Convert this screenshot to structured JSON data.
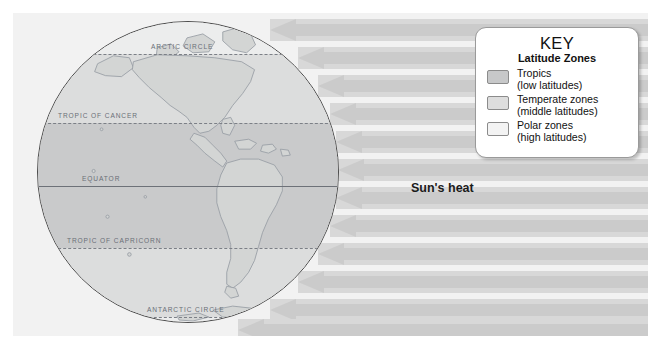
{
  "diagram": {
    "sun_heat_label": "Sun's heat"
  },
  "globe": {
    "latitude_labels": [
      {
        "name": "arctic-circle",
        "text": "ARCTIC CIRCLE"
      },
      {
        "name": "tropic-of-cancer",
        "text": "TROPIC OF CANCER"
      },
      {
        "name": "equator",
        "text": "EQUATOR"
      },
      {
        "name": "tropic-of-capricorn",
        "text": "TROPIC OF CAPRICORN"
      },
      {
        "name": "antarctic-circle",
        "text": "ANTARCTIC CIRCLE"
      }
    ]
  },
  "key": {
    "title": "KEY",
    "subtitle": "Latitude Zones",
    "entries": [
      {
        "label": "Tropics",
        "sub": "(low latitudes)",
        "color": "#c7c8c9"
      },
      {
        "label": "Temperate zones",
        "sub": "(middle latitudes)",
        "color": "#dddddd"
      },
      {
        "label": "Polar zones",
        "sub": "(high latitudes)",
        "color": "#f3f3f3"
      }
    ]
  },
  "colors": {
    "background": "#f2f2f2",
    "ray": "#cbcbcb",
    "tropics_zone": "#c9cacb",
    "temperate_zone": "#dcdddd",
    "polar_zone": "#eceded",
    "globe_outline": "#4c4c4c",
    "land_outline": "#9aa0a6"
  },
  "rays": {
    "count": 12,
    "direction": "left"
  }
}
